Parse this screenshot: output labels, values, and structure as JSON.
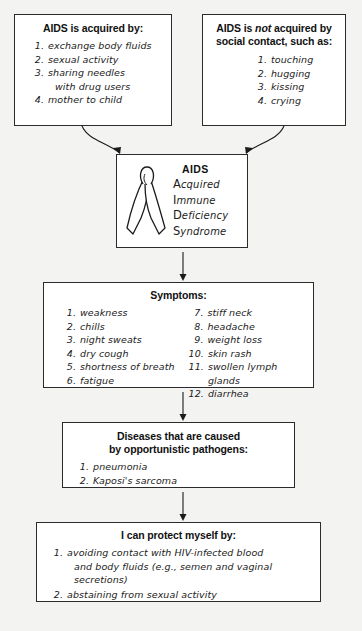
{
  "diagram": {
    "title_implicit": "AIDS concept map",
    "acquired_box": {
      "heading": "AIDS is acquired by:",
      "items": [
        {
          "num": "1.",
          "text": "exchange body fluids"
        },
        {
          "num": "2.",
          "text": "sexual activity"
        },
        {
          "num": "3.",
          "text": "sharing needles",
          "sub": "with drug users"
        },
        {
          "num": "4.",
          "text": "mother to child"
        }
      ]
    },
    "not_acquired_box": {
      "heading_pre": "AIDS is ",
      "heading_italic": "not",
      "heading_post": " acquired by",
      "heading_line2": "social contact, such as:",
      "items": [
        {
          "num": "1.",
          "text": "touching"
        },
        {
          "num": "2.",
          "text": "hugging"
        },
        {
          "num": "3.",
          "text": "kissing"
        },
        {
          "num": "4.",
          "text": "crying"
        }
      ]
    },
    "center_box": {
      "acronym_title": "AIDS",
      "icon": "awareness-ribbon",
      "rows": [
        {
          "cap": "A",
          "rest": "cquired"
        },
        {
          "cap": "I",
          "rest": "mmune"
        },
        {
          "cap": "D",
          "rest": "eficiency"
        },
        {
          "cap": "S",
          "rest": "yndrome"
        }
      ]
    },
    "symptoms_box": {
      "heading": "Symptoms:",
      "column_left": [
        {
          "num": "1.",
          "text": "weakness"
        },
        {
          "num": "2.",
          "text": "chills"
        },
        {
          "num": "3.",
          "text": "night sweats"
        },
        {
          "num": "4.",
          "text": "dry cough"
        },
        {
          "num": "5.",
          "text": "shortness of breath"
        },
        {
          "num": "6.",
          "text": "fatigue"
        }
      ],
      "column_right": [
        {
          "num": "7.",
          "text": "stiff neck"
        },
        {
          "num": "8.",
          "text": "headache"
        },
        {
          "num": "9.",
          "text": "weight loss"
        },
        {
          "num": "10.",
          "text": "skin rash"
        },
        {
          "num": "11.",
          "text": "swollen lymph glands"
        },
        {
          "num": "12.",
          "text": "diarrhea"
        }
      ]
    },
    "diseases_box": {
      "heading_line1": "Diseases that are caused",
      "heading_line2": "by opportunistic pathogens:",
      "items": [
        {
          "num": "1.",
          "text": "pneumonia"
        },
        {
          "num": "2.",
          "text": "Kaposi's sarcoma"
        }
      ]
    },
    "protect_box": {
      "heading": "I can protect myself by:",
      "items": [
        {
          "num": "1.",
          "text": "avoiding contact with HIV-infected blood",
          "sub1": "and body fluids (e.g., semen and vaginal",
          "sub2": "secretions)"
        },
        {
          "num": "2.",
          "text": "abstaining from sexual activity"
        }
      ]
    }
  },
  "colors": {
    "ink": "#1b1b1b",
    "border": "#2b2b2b",
    "shadow": "#1a1a1a",
    "page_bg": "#f3f3f1",
    "box_bg": "#ffffff"
  }
}
